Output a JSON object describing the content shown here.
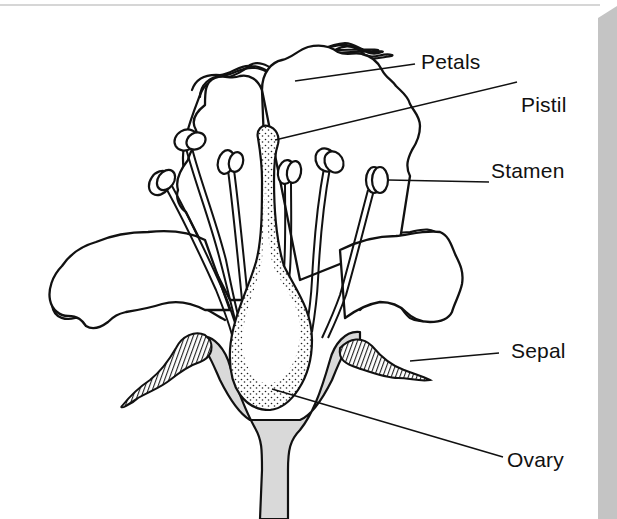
{
  "diagram": {
    "labels": [
      {
        "id": "petals",
        "text": "Petals"
      },
      {
        "id": "pistil",
        "text": "Pistil"
      },
      {
        "id": "stamen",
        "text": "Stamen"
      },
      {
        "id": "sepal",
        "text": "Sepal"
      },
      {
        "id": "ovary",
        "text": "Ovary"
      }
    ],
    "colors": {
      "line": "#111111",
      "receptacle_fill": "#d9d9d9",
      "sepal_fill": "#444444",
      "shadow": "#c4c4c4"
    }
  }
}
